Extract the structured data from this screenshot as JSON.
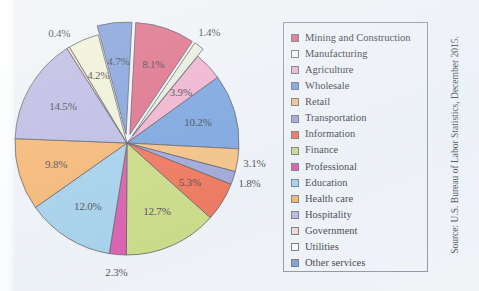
{
  "figure": {
    "source_note": "Source: U.S. Bureau of Labor Statistics, December 2015."
  },
  "chart_data": {
    "type": "pie",
    "title": "",
    "xlabel": "",
    "ylabel": "",
    "legend_position": "right",
    "grid": false,
    "units": "percent",
    "categories": [
      "Mining and Construction",
      "Manufacturing",
      "Agriculture",
      "Wholesale",
      "Retail",
      "Transportation",
      "Information",
      "Finance",
      "Professional",
      "Education",
      "Health care",
      "Hospitality",
      "Government",
      "Utilities",
      "Other services"
    ],
    "values": [
      8.1,
      1.4,
      3.9,
      10.2,
      3.1,
      1.8,
      5.3,
      12.7,
      2.3,
      12.0,
      9.8,
      14.5,
      0.4,
      4.2,
      4.7
    ],
    "labels": [
      "8.1%",
      "1.4%",
      "3.9%",
      "10.2%",
      "3.1%",
      "1.8%",
      "5.3%",
      "12.7%",
      "2.3%",
      "12.0%",
      "9.8%",
      "14.5%",
      "0.4%",
      "4.2%",
      "4.7%"
    ],
    "colors": [
      "#d9526f",
      "#e3ecd8",
      "#efa3c4",
      "#5f91d8",
      "#f5b568",
      "#8d93ce",
      "#ef5533",
      "#c2d469",
      "#d5379a",
      "#93c7e8",
      "#f6a753",
      "#b0aede",
      "#f3cfc9",
      "#eef0cf",
      "#6a8ed4"
    ],
    "exploded": [
      true,
      true,
      false,
      false,
      false,
      false,
      false,
      false,
      false,
      false,
      false,
      false,
      false,
      false,
      true
    ]
  },
  "legend": {
    "items": [
      {
        "label": "Mining and Construction",
        "color": "#d9526f"
      },
      {
        "label": "Manufacturing",
        "color": "#f6f7f0"
      },
      {
        "label": "Agriculture",
        "color": "#efa3c4"
      },
      {
        "label": "Wholesale",
        "color": "#5f91d8"
      },
      {
        "label": "Retail",
        "color": "#f5b568"
      },
      {
        "label": "Transportation",
        "color": "#8d93ce"
      },
      {
        "label": "Information",
        "color": "#ef5533"
      },
      {
        "label": "Finance",
        "color": "#c2d469"
      },
      {
        "label": "Professional",
        "color": "#d5379a"
      },
      {
        "label": "Education",
        "color": "#93c7e8"
      },
      {
        "label": "Health care",
        "color": "#f6a753"
      },
      {
        "label": "Hospitality",
        "color": "#b0aede"
      },
      {
        "label": "Government",
        "color": "#f3cfc9"
      },
      {
        "label": "Utilities",
        "color": "#fdfdf6"
      },
      {
        "label": "Other services",
        "color": "#6a8ed4"
      }
    ]
  }
}
